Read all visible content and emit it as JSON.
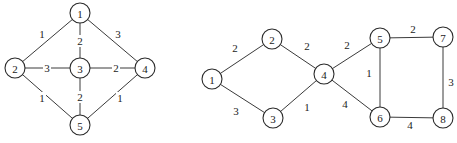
{
  "graphs": [
    {
      "name": "left-graph",
      "node_radius": 10,
      "nodes": [
        {
          "id": "1",
          "label": "1",
          "x": 80,
          "y": 13
        },
        {
          "id": "2",
          "label": "2",
          "x": 15,
          "y": 68
        },
        {
          "id": "3",
          "label": "3",
          "x": 80,
          "y": 68
        },
        {
          "id": "4",
          "label": "4",
          "x": 145,
          "y": 68
        },
        {
          "id": "5",
          "label": "5",
          "x": 80,
          "y": 125
        }
      ],
      "edges": [
        {
          "from": "1",
          "to": "2",
          "weight": "1",
          "lx": 42,
          "ly": 34
        },
        {
          "from": "1",
          "to": "3",
          "weight": "2",
          "lx": 80,
          "ly": 41
        },
        {
          "from": "1",
          "to": "4",
          "weight": "3",
          "lx": 118,
          "ly": 34
        },
        {
          "from": "2",
          "to": "3",
          "weight": "3",
          "lx": 47,
          "ly": 68
        },
        {
          "from": "3",
          "to": "4",
          "weight": "2",
          "lx": 116,
          "ly": 68
        },
        {
          "from": "2",
          "to": "5",
          "weight": "1",
          "lx": 42,
          "ly": 98
        },
        {
          "from": "3",
          "to": "5",
          "weight": "2",
          "lx": 80,
          "ly": 97
        },
        {
          "from": "4",
          "to": "5",
          "weight": "1",
          "lx": 120,
          "ly": 98
        }
      ]
    },
    {
      "name": "right-graph",
      "node_radius": 10,
      "nodes": [
        {
          "id": "1",
          "label": "1",
          "x": 212,
          "y": 79
        },
        {
          "id": "2",
          "label": "2",
          "x": 272,
          "y": 39
        },
        {
          "id": "3",
          "label": "3",
          "x": 273,
          "y": 118
        },
        {
          "id": "4",
          "label": "4",
          "x": 324,
          "y": 74
        },
        {
          "id": "5",
          "label": "5",
          "x": 380,
          "y": 38
        },
        {
          "id": "6",
          "label": "6",
          "x": 380,
          "y": 117
        },
        {
          "id": "7",
          "label": "7",
          "x": 443,
          "y": 37
        },
        {
          "id": "8",
          "label": "8",
          "x": 443,
          "y": 118
        }
      ],
      "edges": [
        {
          "from": "1",
          "to": "2",
          "weight": "2",
          "lx": 235,
          "ly": 48
        },
        {
          "from": "1",
          "to": "3",
          "weight": "3",
          "lx": 236,
          "ly": 111
        },
        {
          "from": "2",
          "to": "4",
          "weight": "2",
          "lx": 307,
          "ly": 46
        },
        {
          "from": "3",
          "to": "4",
          "weight": "1",
          "lx": 307,
          "ly": 107
        },
        {
          "from": "4",
          "to": "5",
          "weight": "2",
          "lx": 347,
          "ly": 45
        },
        {
          "from": "4",
          "to": "6",
          "weight": "4",
          "lx": 345,
          "ly": 104
        },
        {
          "from": "5",
          "to": "6",
          "weight": "1",
          "lx": 369,
          "ly": 73
        },
        {
          "from": "5",
          "to": "7",
          "weight": "2",
          "lx": 413,
          "ly": 29
        },
        {
          "from": "7",
          "to": "8",
          "weight": "3",
          "lx": 451,
          "ly": 82
        },
        {
          "from": "6",
          "to": "8",
          "weight": "4",
          "lx": 410,
          "ly": 125
        }
      ]
    }
  ]
}
